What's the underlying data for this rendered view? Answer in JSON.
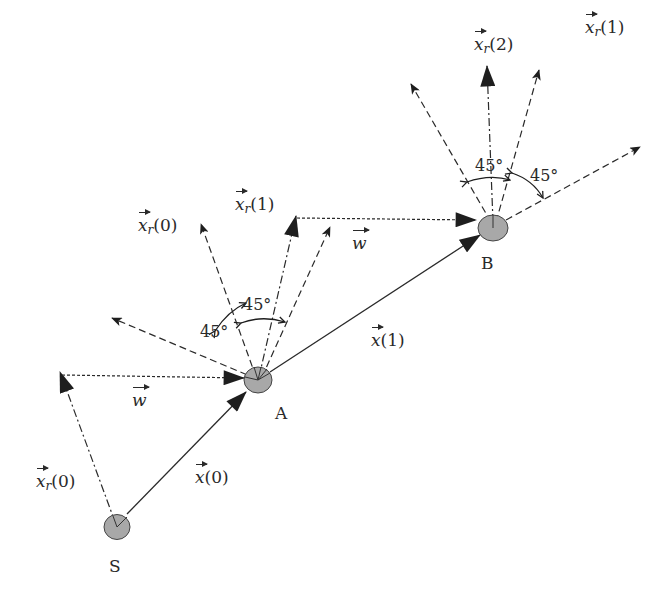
{
  "diagram": {
    "nodes": {
      "S": {
        "label": "S"
      },
      "A": {
        "label": "A"
      },
      "B": {
        "label": "B"
      }
    },
    "vectors": {
      "x0": {
        "symbol": "x",
        "arg": "(0)"
      },
      "x1": {
        "symbol": "x",
        "arg": "(1)"
      },
      "w_lower": {
        "symbol": "w",
        "arg": ""
      },
      "w_upper": {
        "symbol": "w",
        "arg": ""
      },
      "xr0_S": {
        "symbol": "x",
        "sub": "r",
        "arg": "(0)"
      },
      "xr0_A": {
        "symbol": "x",
        "sub": "r",
        "arg": "(0)"
      },
      "xr1_A": {
        "symbol": "x",
        "sub": "r",
        "arg": "(1)"
      },
      "xr2_B": {
        "symbol": "x",
        "sub": "r",
        "arg": "(2)"
      },
      "xr1_B": {
        "symbol": "x",
        "sub": "r",
        "arg": "(1)"
      }
    },
    "angles": {
      "A_left": "45°",
      "A_top": "45°",
      "B_top": "45°",
      "B_right": "45°"
    },
    "colors": {
      "line": "#2a2a2a",
      "node_fill": "#a8a8a8",
      "background": "#ffffff"
    }
  }
}
